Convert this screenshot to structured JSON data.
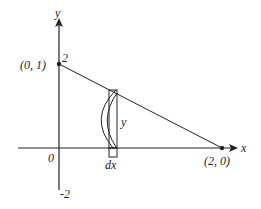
{
  "diagram": {
    "axes": {
      "x_label": "x",
      "y_label": "y",
      "origin_label": "0",
      "y_tick_top": "2",
      "y_tick_bottom": "-2"
    },
    "points": {
      "p1_label": "(0, 1)",
      "p2_label": "(2, 0)"
    },
    "strip": {
      "height_label": "y",
      "width_label": "dx"
    },
    "colors": {
      "stroke": "#222222",
      "background": "#ffffff"
    }
  }
}
